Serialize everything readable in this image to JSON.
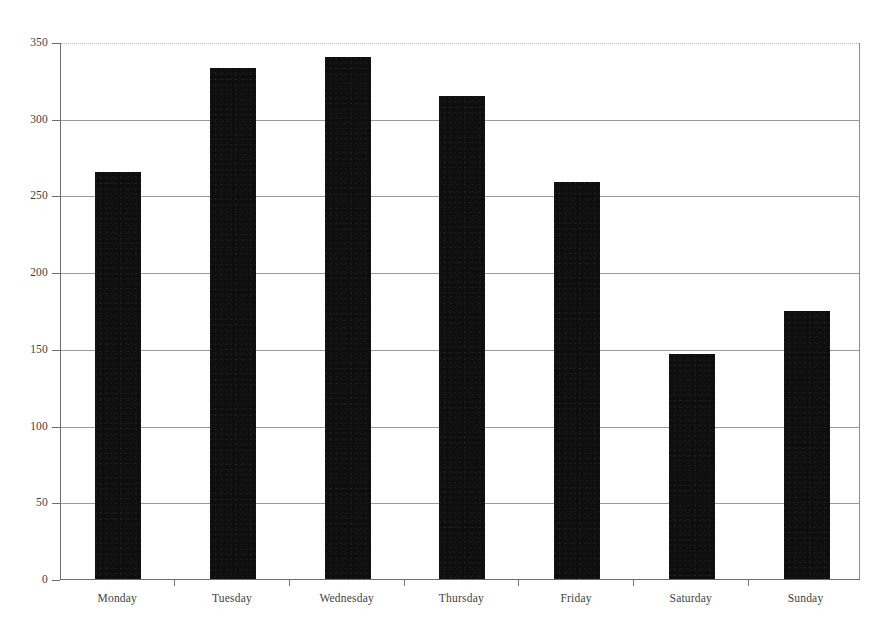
{
  "chart_data": {
    "type": "bar",
    "title": "",
    "subtitle": "",
    "xlabel": "",
    "ylabel": "",
    "categories": [
      "Monday",
      "Tuesday",
      "Wednesday",
      "Thursday",
      "Friday",
      "Saturday",
      "Sunday"
    ],
    "values": [
      265,
      333,
      340,
      315,
      259,
      147,
      175
    ],
    "series": [
      {
        "name": "",
        "values": [
          265,
          333,
          340,
          315,
          259,
          147,
          175
        ]
      }
    ],
    "ylim": [
      0,
      350
    ],
    "yticks": [
      0,
      50,
      100,
      150,
      200,
      250,
      300,
      350
    ],
    "ytick_labels": [
      "0",
      "50",
      "100",
      "150",
      "200",
      "250",
      "300",
      "350"
    ],
    "grid": true,
    "grid_axis": "y",
    "legend": false,
    "legend_position": "none",
    "bar_color": "#0e0e0e",
    "grid_color": "#9a9a9a",
    "axis_color": "#6e6e6e",
    "text_color": "#3f3f3f",
    "background": "#ffffff",
    "annotations": []
  }
}
